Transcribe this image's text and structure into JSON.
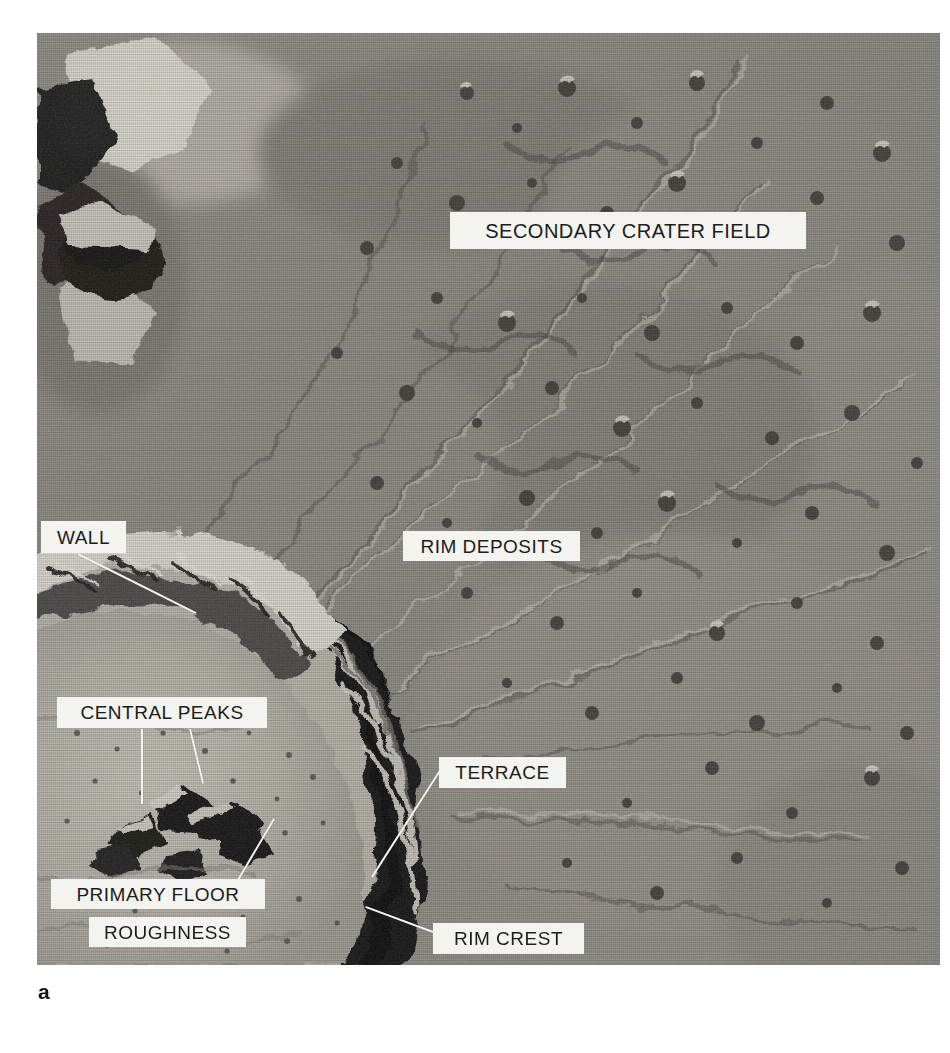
{
  "figure": {
    "caption": "a",
    "kind": "annotated-lunar-orbiter-photograph"
  },
  "photo": {
    "x": 37,
    "y": 33,
    "width": 903,
    "height": 932,
    "palette": {
      "highlight": "#e8e6df",
      "bright": "#c9c6bd",
      "midtone": "#9a978e",
      "mid_dark": "#6f6d66",
      "shadow": "#2a2a28",
      "deep_shadow": "#0d0d0c",
      "label_fill": "#f3f3ef",
      "label_text": "#1c1c1c",
      "leader_line": "#f4f4f0"
    }
  },
  "annotations": [
    {
      "id": "secondary-crater-field",
      "text": "SECONDARY CRATER FIELD",
      "x": 450,
      "y": 212,
      "w": 356,
      "h": 37,
      "font_size": 20,
      "leader": null
    },
    {
      "id": "rim-deposits",
      "text": "RIM DEPOSITS",
      "x": 403,
      "y": 531,
      "w": 177,
      "h": 30,
      "font_size": 19,
      "leader": null
    },
    {
      "id": "wall",
      "text": "WALL",
      "x": 41,
      "y": 521,
      "w": 85,
      "h": 32,
      "font_size": 19,
      "leader": {
        "x1": 78,
        "y1": 553,
        "x2": 196,
        "y2": 612
      }
    },
    {
      "id": "central-peaks",
      "text": "CENTRAL PEAKS",
      "x": 57,
      "y": 697,
      "w": 210,
      "h": 31,
      "font_size": 19,
      "leader": {
        "x1": 142,
        "y1": 728,
        "x2": 142,
        "y2": 803
      },
      "leader2": {
        "x1": 190,
        "y1": 728,
        "x2": 203,
        "y2": 782
      }
    },
    {
      "id": "terrace",
      "text": "TERRACE",
      "x": 439,
      "y": 757,
      "w": 127,
      "h": 31,
      "font_size": 19,
      "leader": {
        "x1": 441,
        "y1": 768,
        "x2": 372,
        "y2": 876
      }
    },
    {
      "id": "primary-floor",
      "text": "PRIMARY FLOOR",
      "x": 51,
      "y": 879,
      "w": 214,
      "h": 30,
      "font_size": 19,
      "leader": {
        "x1": 238,
        "y1": 879,
        "x2": 274,
        "y2": 818
      }
    },
    {
      "id": "roughness",
      "text": "ROUGHNESS",
      "x": 89,
      "y": 917,
      "w": 157,
      "h": 30,
      "font_size": 19,
      "leader": null
    },
    {
      "id": "rim-crest",
      "text": "RIM CREST",
      "x": 433,
      "y": 923,
      "w": 151,
      "h": 31,
      "font_size": 19,
      "leader": {
        "x1": 433,
        "y1": 931,
        "x2": 366,
        "y2": 906
      }
    }
  ]
}
